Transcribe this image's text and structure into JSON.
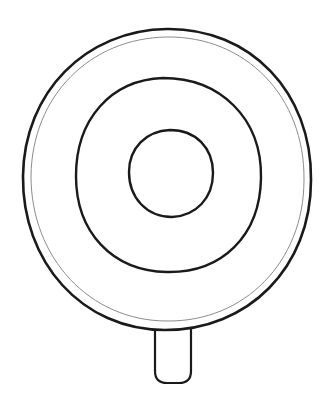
{
  "drawing": {
    "subject": "lollipop-outline",
    "colors": {
      "background": "#ffffff",
      "stroke": "#1a1a1a",
      "inner_rim": "#8c8c8c"
    },
    "outer_circle": {
      "cx": 167,
      "cy": 179,
      "rx": 145,
      "ry": 151
    },
    "rim_circle": {
      "cx": 167,
      "cy": 180,
      "rx": 138,
      "ry": 144
    },
    "middle_ring": {
      "cx": 168,
      "cy": 175,
      "rx": 93,
      "ry": 97
    },
    "inner_ring": {
      "cx": 170,
      "cy": 173,
      "rx": 42,
      "ry": 43
    },
    "stick": {
      "x": 155,
      "y": 329,
      "width": 36,
      "height": 54,
      "radius": 12
    }
  }
}
